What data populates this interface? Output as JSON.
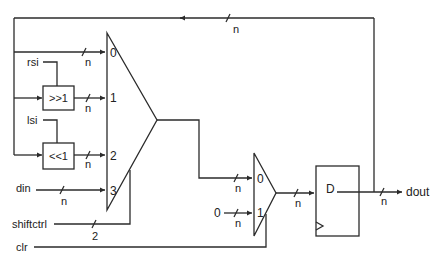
{
  "diagram": {
    "bus_width_label": "n",
    "select_width_label": "2",
    "main_mux": {
      "inputs": [
        "0",
        "1",
        "2",
        "3"
      ]
    },
    "output_mux": {
      "inputs": [
        "0",
        "1"
      ],
      "constant_input": "0"
    },
    "blocks": {
      "shift_right": ">>1",
      "shift_left": "<<1",
      "register_d": "D"
    },
    "signals": {
      "rsi": "rsi",
      "lsi": "lsi",
      "din": "din",
      "shiftctrl": "shiftctrl",
      "clr": "clr",
      "dout": "dout"
    }
  }
}
